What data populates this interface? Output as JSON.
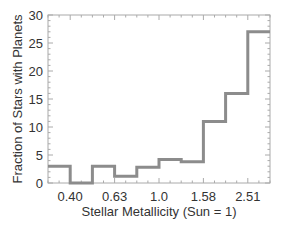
{
  "chart_data": {
    "type": "bar",
    "style": "step-histogram",
    "title": "",
    "xlabel": "Stellar Metallicity (Sun = 1)",
    "ylabel": "Fraction of Stars with Planets",
    "ylim": [
      0,
      30
    ],
    "yticks": [
      0,
      5,
      10,
      15,
      20,
      25,
      30
    ],
    "xtick_labels": [
      "0.40",
      "0.63",
      "1.0",
      "1.58",
      "2.51"
    ],
    "bins": 10,
    "values": [
      3.0,
      0.0,
      3.0,
      1.2,
      2.8,
      4.2,
      3.8,
      11.0,
      16.0,
      27.0
    ],
    "grid": false,
    "line_color": "#8c8c8c"
  }
}
